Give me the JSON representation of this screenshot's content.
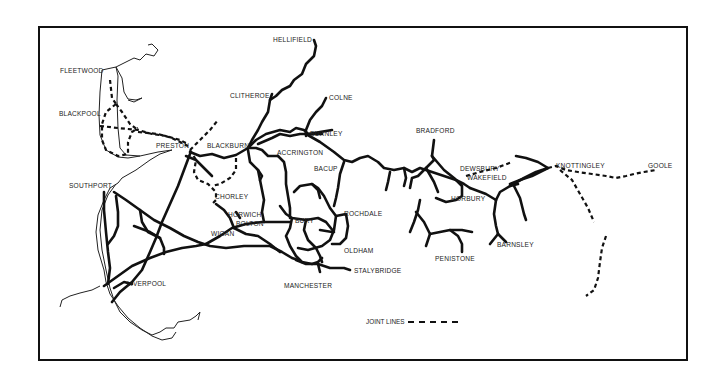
{
  "map": {
    "type": "railway network map",
    "region": "Lancashire & Yorkshire",
    "line_color": "#111111",
    "background": "#ffffff"
  },
  "places": {
    "hellifield": "HELLIFIELD",
    "fleetwood": "FLEETWOOD",
    "clitheroe": "CLITHEROE",
    "colne": "COLNE",
    "blackpool": "BLACKPOOL",
    "burnley": "BURNLEY",
    "bradford": "BRADFORD",
    "preston": "PRESTON",
    "blackburn": "BLACKBURN",
    "accrington": "ACCRINGTON",
    "dewsbury": "DEWSBURY",
    "knottingley": "KNOTTINGLEY",
    "goole": "GOOLE",
    "wakefield": "WAKEFIELD",
    "southport": "SOUTHPORT",
    "bacup": "BACUP",
    "horbury": "HORBURY",
    "chorley": "CHORLEY",
    "horwich": "HORWICH",
    "bolton": "BOLTON",
    "rochdale": "ROCHDALE",
    "bury": "BURY",
    "barnsley": "BARNSLEY",
    "wigan": "WIGAN",
    "oldham": "OLDHAM",
    "penistone": "PENISTONE",
    "liverpool": "LIVERPOOL",
    "stalybridge": "STALYBRIDGE",
    "manchester": "MANCHESTER"
  },
  "legend": {
    "joint_lines_label": "JOINT  LINES"
  }
}
